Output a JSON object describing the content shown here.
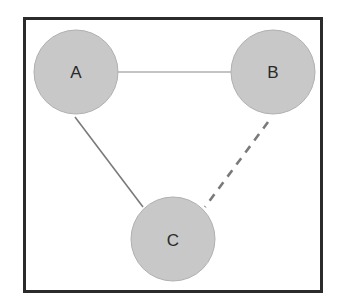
{
  "diagram": {
    "frame": {
      "x": 23,
      "y": 17,
      "width": 300,
      "height": 276,
      "stroke": "#2b2b2b"
    },
    "node_fill": "#c8c8c8",
    "node_stroke": "#b0b0b0",
    "edge_color": "#7a7a7a",
    "nodes": [
      {
        "id": "A",
        "label": "A",
        "cx": 76,
        "cy": 72,
        "r": 42
      },
      {
        "id": "B",
        "label": "B",
        "cx": 273,
        "cy": 72,
        "r": 42
      },
      {
        "id": "C",
        "label": "C",
        "cx": 173,
        "cy": 239,
        "r": 42
      }
    ],
    "edges": [
      {
        "from": "A",
        "to": "B",
        "style": "solid-thin",
        "x1": 118,
        "y1": 72,
        "x2": 231,
        "y2": 72
      },
      {
        "from": "A",
        "to": "C",
        "style": "solid",
        "x1": 75,
        "y1": 117,
        "x2": 143,
        "y2": 207
      },
      {
        "from": "B",
        "to": "C",
        "style": "dashed",
        "x1": 268,
        "y1": 122,
        "x2": 205,
        "y2": 205
      }
    ]
  }
}
